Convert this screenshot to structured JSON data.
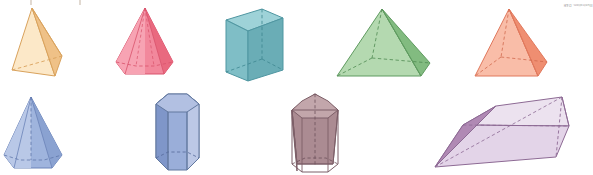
{
  "figure": {
    "background": "#ffffff",
    "width": 588,
    "height": 175,
    "rows": 2,
    "columns": 4
  },
  "credit": {
    "text": "Illustration: D&E"
  },
  "artifacts": [
    {
      "name": "page-crumb-left",
      "x": 30
    },
    {
      "name": "page-crumb-right",
      "x": 79
    }
  ],
  "shapes": [
    {
      "id": "triangular-pyramid",
      "label": "Triangular pyramid",
      "row": 1,
      "column": 1,
      "fill": "#f8d7a8",
      "fill_light": "#fce8c8",
      "fill_dark": "#efc187",
      "stroke": "#d9a25c"
    },
    {
      "id": "hexagonal-pyramid-pink",
      "label": "Hexagonal pyramid",
      "row": 1,
      "column": 2,
      "fill": "#f2889c",
      "fill_light": "#f7a3b3",
      "fill_dark": "#e9697f",
      "stroke": "#d9536c"
    },
    {
      "id": "rectangular-prism",
      "label": "Rectangular prism",
      "row": 1,
      "column": 3,
      "fill": "#7fbec6",
      "fill_light": "#9ed2d8",
      "fill_dark": "#6aadb6",
      "stroke": "#4f96a1"
    },
    {
      "id": "square-pyramid-green",
      "label": "Square pyramid",
      "row": 1,
      "column": 4,
      "fill": "#97ca94",
      "fill_light": "#b4d9b0",
      "fill_dark": "#82bb80",
      "stroke": "#5f9b60"
    },
    {
      "id": "square-pyramid-orange",
      "label": "Square pyramid",
      "row": 1,
      "column": 5,
      "fill": "#f5a186",
      "fill_light": "#f9bda8",
      "fill_dark": "#ef8e71",
      "stroke": "#e0785c"
    },
    {
      "id": "hexagonal-pyramid-blue",
      "label": "Hexagonal pyramid",
      "row": 2,
      "column": 1,
      "fill": "#9fb4dd",
      "fill_light": "#b9c8e7",
      "fill_dark": "#8aa2d1",
      "stroke": "#6b83b8"
    },
    {
      "id": "hexagonal-prism",
      "label": "Hexagonal prism",
      "row": 2,
      "column": 2,
      "fill": "#9aaed9",
      "fill_light": "#bcc8e6",
      "fill_dark": "#7f96c9",
      "stroke": "#62789f"
    },
    {
      "id": "pentagonal-prism",
      "label": "Pentagonal prism",
      "row": 2,
      "column": 3,
      "fill": "#ab8b92",
      "fill_light": "#c2a6ab",
      "fill_dark": "#9b7a82",
      "stroke": "#7d5f68"
    },
    {
      "id": "triangular-prism",
      "label": "Triangular prism",
      "row": 2,
      "column": 4,
      "fill": "#e3d4e8",
      "fill_light": "#ece2ef",
      "fill_dark": "#b089b4",
      "stroke": "#8d6a94"
    }
  ]
}
